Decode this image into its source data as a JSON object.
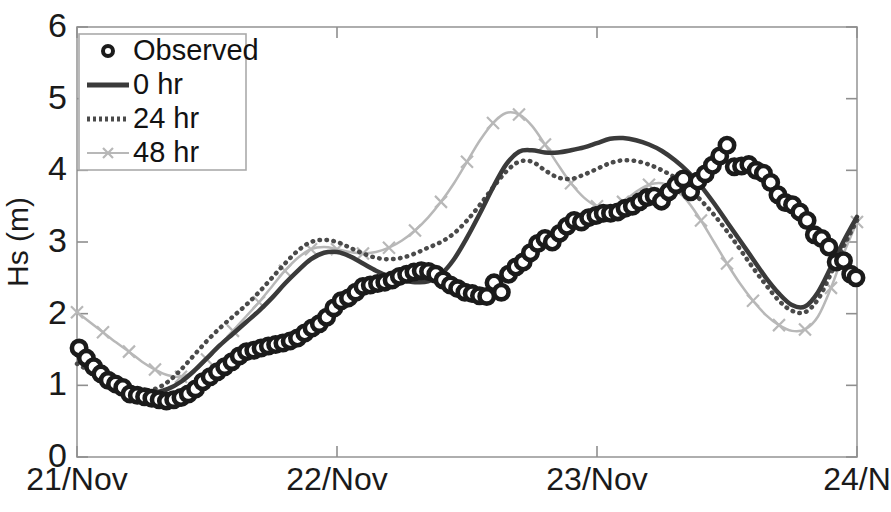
{
  "figure": {
    "width": 891,
    "height": 512,
    "background": "#ffffff"
  },
  "axes": {
    "x": 77,
    "y": 27,
    "right": 857,
    "bottom": 457,
    "frame_color": "#9a9a9a",
    "tick_color": "#8f8f8f"
  },
  "chart_data": {
    "type": "line",
    "title": "",
    "subtitle": "",
    "xlabel": "",
    "ylabel": "Hs (m)",
    "xlim": [
      0,
      3
    ],
    "ylim": [
      0,
      6
    ],
    "grid": false,
    "legend_position": "upper-left",
    "x_tick_labels": [
      "21/Nov",
      "22/Nov",
      "23/Nov",
      "24/N"
    ],
    "x_tick_values": [
      0,
      1,
      2,
      3
    ],
    "y_tick_labels": [
      "0",
      "1",
      "2",
      "3",
      "4",
      "5",
      "6"
    ],
    "y_tick_values": [
      0,
      1,
      2,
      3,
      4,
      5,
      6
    ],
    "x_unit": "day (November)",
    "y_unit": "m",
    "series": [
      {
        "name": "Observed",
        "style": "markers",
        "marker": "open-circle",
        "color": "#1b1b1b",
        "x": [
          0.008,
          0.036,
          0.064,
          0.092,
          0.12,
          0.148,
          0.176,
          0.204,
          0.232,
          0.26,
          0.288,
          0.316,
          0.344,
          0.372,
          0.4,
          0.428,
          0.456,
          0.484,
          0.512,
          0.54,
          0.568,
          0.596,
          0.624,
          0.652,
          0.68,
          0.708,
          0.736,
          0.764,
          0.792,
          0.82,
          0.848,
          0.876,
          0.904,
          0.932,
          0.96,
          0.988,
          1.016,
          1.044,
          1.072,
          1.1,
          1.128,
          1.156,
          1.184,
          1.212,
          1.24,
          1.268,
          1.296,
          1.324,
          1.352,
          1.38,
          1.408,
          1.436,
          1.464,
          1.492,
          1.52,
          1.548,
          1.576,
          1.604,
          1.632,
          1.66,
          1.688,
          1.716,
          1.744,
          1.772,
          1.8,
          1.828,
          1.856,
          1.884,
          1.912,
          1.94,
          1.968,
          1.996,
          2.024,
          2.052,
          2.08,
          2.108,
          2.136,
          2.164,
          2.192,
          2.22,
          2.248,
          2.276,
          2.304,
          2.332,
          2.36,
          2.388,
          2.416,
          2.444,
          2.472,
          2.5,
          2.528,
          2.556,
          2.584,
          2.612,
          2.64,
          2.668,
          2.696,
          2.724,
          2.752,
          2.78,
          2.808,
          2.836,
          2.864,
          2.892,
          2.92,
          2.948,
          2.976,
          2.996
        ],
        "y": [
          1.52,
          1.38,
          1.26,
          1.16,
          1.07,
          1.02,
          0.97,
          0.88,
          0.86,
          0.84,
          0.82,
          0.8,
          0.78,
          0.8,
          0.83,
          0.88,
          0.95,
          1.05,
          1.12,
          1.19,
          1.26,
          1.33,
          1.41,
          1.47,
          1.49,
          1.52,
          1.55,
          1.57,
          1.59,
          1.62,
          1.66,
          1.73,
          1.8,
          1.86,
          1.95,
          2.08,
          2.18,
          2.22,
          2.3,
          2.38,
          2.4,
          2.42,
          2.44,
          2.47,
          2.52,
          2.55,
          2.58,
          2.6,
          2.59,
          2.55,
          2.47,
          2.4,
          2.35,
          2.3,
          2.28,
          2.25,
          2.24,
          2.43,
          2.3,
          2.55,
          2.65,
          2.72,
          2.85,
          2.98,
          3.05,
          3.0,
          3.12,
          3.22,
          3.3,
          3.28,
          3.34,
          3.37,
          3.4,
          3.4,
          3.42,
          3.47,
          3.5,
          3.56,
          3.62,
          3.64,
          3.57,
          3.7,
          3.8,
          3.88,
          3.7,
          3.85,
          3.95,
          4.07,
          4.2,
          4.35,
          4.05,
          4.06,
          4.08,
          4.0,
          3.96,
          3.83,
          3.66,
          3.55,
          3.52,
          3.42,
          3.3,
          3.1,
          3.05,
          2.93,
          2.72,
          2.74,
          2.55,
          2.5
        ]
      },
      {
        "name": "0 hr",
        "style": "solid-line",
        "color": "#3a3a3a",
        "linewidth": 4.5,
        "x": [
          0.0,
          0.05,
          0.1,
          0.15,
          0.2,
          0.25,
          0.3,
          0.35,
          0.4,
          0.45,
          0.5,
          0.55,
          0.6,
          0.65,
          0.7,
          0.75,
          0.8,
          0.85,
          0.9,
          0.95,
          1.0,
          1.05,
          1.1,
          1.15,
          1.2,
          1.25,
          1.3,
          1.35,
          1.4,
          1.45,
          1.5,
          1.55,
          1.6,
          1.65,
          1.7,
          1.75,
          1.8,
          1.85,
          1.9,
          1.95,
          2.0,
          2.05,
          2.1,
          2.15,
          2.2,
          2.25,
          2.3,
          2.35,
          2.4,
          2.45,
          2.5,
          2.55,
          2.6,
          2.65,
          2.7,
          2.75,
          2.8,
          2.85,
          2.9,
          2.95,
          3.0
        ],
        "y": [
          1.42,
          1.3,
          1.17,
          1.06,
          0.98,
          0.92,
          0.9,
          0.95,
          1.05,
          1.2,
          1.38,
          1.56,
          1.72,
          1.88,
          2.04,
          2.22,
          2.42,
          2.6,
          2.76,
          2.85,
          2.86,
          2.8,
          2.7,
          2.6,
          2.52,
          2.47,
          2.44,
          2.45,
          2.55,
          2.76,
          3.06,
          3.4,
          3.76,
          4.08,
          4.26,
          4.28,
          4.25,
          4.25,
          4.28,
          4.32,
          4.38,
          4.44,
          4.45,
          4.42,
          4.36,
          4.27,
          4.14,
          3.98,
          3.78,
          3.54,
          3.28,
          3.02,
          2.76,
          2.5,
          2.28,
          2.12,
          2.1,
          2.3,
          2.65,
          3.02,
          3.35
        ]
      },
      {
        "name": "24 hr",
        "style": "dotted-line",
        "color": "#4a4a4a",
        "linewidth": 4.5,
        "x": [
          0.0,
          0.05,
          0.1,
          0.15,
          0.2,
          0.25,
          0.3,
          0.35,
          0.4,
          0.45,
          0.5,
          0.55,
          0.6,
          0.65,
          0.7,
          0.75,
          0.8,
          0.85,
          0.9,
          0.95,
          1.0,
          1.05,
          1.1,
          1.15,
          1.2,
          1.25,
          1.3,
          1.35,
          1.4,
          1.45,
          1.5,
          1.55,
          1.6,
          1.65,
          1.7,
          1.75,
          1.8,
          1.85,
          1.9,
          1.95,
          2.0,
          2.05,
          2.1,
          2.15,
          2.2,
          2.25,
          2.3,
          2.35,
          2.4,
          2.45,
          2.5,
          2.55,
          2.6,
          2.65,
          2.7,
          2.75,
          2.8,
          2.85,
          2.9,
          2.95,
          3.0
        ],
        "y": [
          1.3,
          1.2,
          1.1,
          1.02,
          0.96,
          0.93,
          0.95,
          1.05,
          1.22,
          1.42,
          1.62,
          1.8,
          1.96,
          2.12,
          2.3,
          2.5,
          2.7,
          2.88,
          3.0,
          3.03,
          3.0,
          2.92,
          2.84,
          2.78,
          2.76,
          2.78,
          2.84,
          2.92,
          3.0,
          3.12,
          3.3,
          3.52,
          3.76,
          3.98,
          4.12,
          4.12,
          4.0,
          3.9,
          3.88,
          3.94,
          4.02,
          4.1,
          4.14,
          4.13,
          4.08,
          4.0,
          3.9,
          3.76,
          3.58,
          3.38,
          3.15,
          2.9,
          2.64,
          2.4,
          2.18,
          2.04,
          2.02,
          2.2,
          2.56,
          2.95,
          3.3
        ]
      },
      {
        "name": "48 hr",
        "style": "line-with-x-markers",
        "marker": "x",
        "color": "#b8b8b8",
        "linewidth": 2.5,
        "x": [
          0.0,
          0.05,
          0.1,
          0.15,
          0.2,
          0.25,
          0.3,
          0.35,
          0.4,
          0.45,
          0.5,
          0.55,
          0.6,
          0.65,
          0.7,
          0.75,
          0.8,
          0.85,
          0.9,
          0.95,
          1.0,
          1.05,
          1.1,
          1.15,
          1.2,
          1.25,
          1.3,
          1.35,
          1.4,
          1.45,
          1.5,
          1.55,
          1.6,
          1.65,
          1.7,
          1.75,
          1.8,
          1.85,
          1.9,
          1.95,
          2.0,
          2.05,
          2.1,
          2.15,
          2.2,
          2.25,
          2.3,
          2.35,
          2.4,
          2.45,
          2.5,
          2.55,
          2.6,
          2.65,
          2.7,
          2.75,
          2.8,
          2.85,
          2.9,
          2.95,
          3.0
        ],
        "y": [
          2.02,
          1.88,
          1.74,
          1.6,
          1.47,
          1.33,
          1.22,
          1.14,
          1.12,
          1.2,
          1.36,
          1.56,
          1.76,
          1.96,
          2.16,
          2.38,
          2.6,
          2.78,
          2.9,
          2.93,
          2.9,
          2.86,
          2.84,
          2.86,
          2.92,
          3.02,
          3.16,
          3.34,
          3.56,
          3.82,
          4.12,
          4.42,
          4.66,
          4.8,
          4.78,
          4.62,
          4.36,
          4.08,
          3.82,
          3.62,
          3.5,
          3.48,
          3.56,
          3.7,
          3.8,
          3.82,
          3.74,
          3.56,
          3.3,
          3.0,
          2.7,
          2.42,
          2.18,
          1.98,
          1.84,
          1.76,
          1.78,
          1.96,
          2.36,
          2.85,
          3.28
        ]
      }
    ]
  },
  "legend": {
    "entries": [
      {
        "label": "Observed",
        "type": "marker"
      },
      {
        "label": "0 hr",
        "type": "solid"
      },
      {
        "label": "24 hr",
        "type": "dotted"
      },
      {
        "label": "48 hr",
        "type": "gray-x"
      }
    ],
    "border_color": "#aaaaaa",
    "background": "#ffffff"
  }
}
